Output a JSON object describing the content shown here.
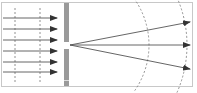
{
  "diagram": {
    "title": "",
    "colors": {
      "background": "#ffffff",
      "frame": "#c8c8c8",
      "barrier": "#9a9a9a",
      "ray": "#555555",
      "arrowhead": "#333333",
      "wavefront": "#777777"
    },
    "incident_rays": [
      {
        "y": 18
      },
      {
        "y": 29
      },
      {
        "y": 40
      },
      {
        "y": 51
      },
      {
        "y": 62
      },
      {
        "y": 72
      }
    ],
    "incident_wavefronts": [
      {
        "x": 15
      },
      {
        "x": 40
      }
    ],
    "barrier": {
      "x": 64,
      "width": 5,
      "upper": {
        "y1": 3,
        "y2": 42
      },
      "lower": {
        "y1": 49,
        "y2": 86
      },
      "slit_center_y": 45
    },
    "diffracted_rays": [
      {
        "end_x": 192,
        "end_y": 22
      },
      {
        "end_x": 192,
        "end_y": 45
      },
      {
        "end_x": 192,
        "end_y": 69
      }
    ],
    "diffracted_wavefronts": [
      {
        "radius": 80
      },
      {
        "radius": 118
      }
    ]
  }
}
